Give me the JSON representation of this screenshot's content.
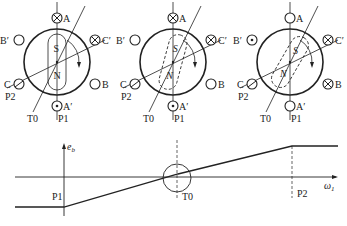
{
  "panels": [
    {
      "id": "panel-1",
      "cx": 57,
      "cy": 62,
      "rotor_angle_deg": 0,
      "poles": {
        "top": "S",
        "bottom": "N"
      },
      "conductors": {
        "A": "cross",
        "A_prime": "dot",
        "B": "empty",
        "B_prime": "empty",
        "C": "slash",
        "C_prime": "cross"
      }
    },
    {
      "id": "panel-2",
      "cx": 173,
      "cy": 62,
      "rotor_angle_deg": 15,
      "poles": {
        "top": "S",
        "bottom": "N"
      },
      "conductors": {
        "A": "cross",
        "A_prime": "dot",
        "B": "empty",
        "B_prime": "empty",
        "C": "slash",
        "C_prime": "cross"
      }
    },
    {
      "id": "panel-3",
      "cx": 290,
      "cy": 62,
      "rotor_angle_deg": 30,
      "poles": {
        "top": "S",
        "bottom": "N"
      },
      "conductors": {
        "A": "empty",
        "A_prime": "empty",
        "B": "cross",
        "B_prime": "dot",
        "C": "slash",
        "C_prime": "cross"
      }
    }
  ],
  "labels": {
    "A": "A",
    "A_prime": "A′",
    "B": "B",
    "B_prime": "B′",
    "C": "C",
    "C_prime": "C′",
    "P1": "P1",
    "P2": "P2",
    "T0": "T0",
    "S": "S",
    "N": "N"
  },
  "graph": {
    "y_axis_label": "e",
    "y_axis_sub": "b",
    "x_axis_label": "ω",
    "x_axis_sub": "1",
    "markers": [
      "P1",
      "T0",
      "P2"
    ]
  },
  "chart_data": {
    "type": "line",
    "title": "",
    "xlabel": "ω1",
    "ylabel": "eb",
    "x": [
      "start",
      "P1",
      "T0",
      "P2",
      "end"
    ],
    "values": [
      -1,
      -1,
      0,
      1,
      1
    ],
    "annotations": [
      "P1",
      "T0",
      "P2"
    ],
    "grid": false
  }
}
